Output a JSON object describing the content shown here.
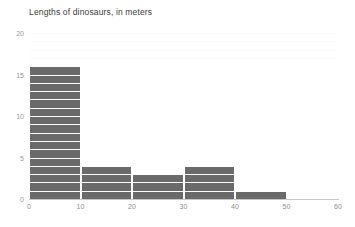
{
  "chart_data": {
    "type": "bar",
    "title": "Lengths of dinosaurs, in meters",
    "xlabel": "",
    "ylabel": "",
    "categories": [
      "0-10",
      "10-20",
      "20-30",
      "30-40",
      "40-50",
      "50-60"
    ],
    "bin_edges": [
      0,
      10,
      20,
      30,
      40,
      50,
      60
    ],
    "values": [
      16,
      4,
      3,
      4,
      1,
      0
    ],
    "xlim": [
      0,
      60
    ],
    "ylim": [
      0,
      20
    ],
    "xticks": [
      "0",
      "10",
      "20",
      "30",
      "40",
      "50",
      "60"
    ],
    "xtick_values": [
      0,
      10,
      20,
      30,
      40,
      50,
      60
    ],
    "yticks": [
      "20",
      "15",
      "10",
      "5",
      "0"
    ],
    "ytick_values": [
      20,
      15,
      10,
      5,
      0
    ],
    "grid": "horizontal-unit-lines-white",
    "legend": "none",
    "bar_color": "#6a6a6a",
    "gridline_color": "#ffffff",
    "axis_color": "#c8c8c8",
    "background": "#ffffff"
  }
}
